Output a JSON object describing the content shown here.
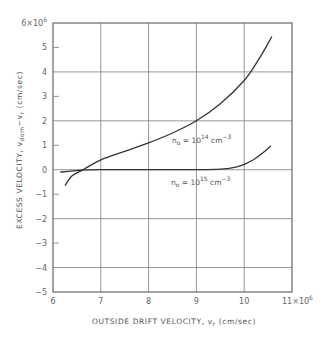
{
  "chart_data": {
    "type": "line",
    "title": "",
    "xlabel": "OUTSIDE DRIFT VELOCITY, v_r (cm/sec)",
    "xlabel_parts": {
      "main": "OUTSIDE DRIFT VELOCITY, v",
      "sub": "r",
      "unit": "(cm/sec)"
    },
    "ylabel": "EXCESS VELOCITY, v_dom − v_r (cm/sec)",
    "ylabel_parts": {
      "main": "EXCESS VELOCITY, v",
      "sub1": "dom",
      "mid": "−v",
      "sub2": "r",
      "unit": "(cm/sec)"
    },
    "xlim": [
      6,
      11
    ],
    "ylim": [
      -5,
      6
    ],
    "x_scale_label": "×10⁶",
    "y_scale_label": "×10⁶",
    "x_ticks": [
      6,
      7,
      8,
      9,
      10,
      11
    ],
    "x_tick_labels": [
      "6",
      "7",
      "8",
      "9",
      "10",
      "11×10⁶"
    ],
    "y_ticks": [
      6,
      5,
      4,
      3,
      2,
      1,
      0,
      -1,
      -2,
      -3,
      -4,
      -5
    ],
    "y_tick_labels": [
      "6×10⁶",
      "5",
      "4",
      "3",
      "2",
      "1",
      "0",
      "−1",
      "−2",
      "−3",
      "−4",
      "−5"
    ],
    "grid": {
      "x_lines": [
        7,
        8,
        9,
        10
      ],
      "y_lines": [
        4,
        2,
        0,
        -2,
        -4
      ]
    },
    "legend": "none (inline curve labels)",
    "series": [
      {
        "name": "n₀ = 10¹⁴ cm⁻³",
        "label": {
          "base": "n",
          "sub": "o",
          "eq": " = 10",
          "sup": "14",
          "unit": " cm",
          "unit_sup": "−3"
        },
        "x": [
          6.25,
          6.4,
          6.63,
          7.0,
          7.5,
          8.0,
          8.5,
          9.0,
          9.5,
          10.0,
          10.3,
          10.58
        ],
        "y": [
          -0.65,
          -0.25,
          0.0,
          0.4,
          0.75,
          1.1,
          1.5,
          2.0,
          2.7,
          3.65,
          4.5,
          5.45
        ]
      },
      {
        "name": "n₀ = 10¹⁵ cm⁻³",
        "label": {
          "base": "n",
          "sub": "o",
          "eq": " = 10",
          "sup": "15",
          "unit": " cm",
          "unit_sup": "−3"
        },
        "x": [
          6.15,
          6.6,
          7.0,
          8.0,
          9.0,
          9.5,
          9.8,
          10.0,
          10.2,
          10.4,
          10.56
        ],
        "y": [
          -0.1,
          -0.02,
          0.0,
          0.0,
          0.0,
          0.02,
          0.1,
          0.22,
          0.42,
          0.7,
          0.98
        ]
      }
    ]
  }
}
